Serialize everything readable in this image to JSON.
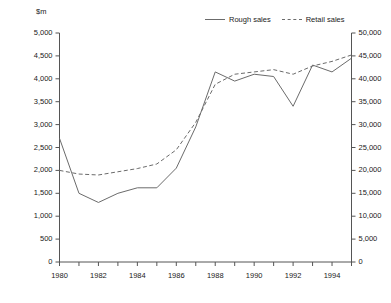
{
  "chart_data": {
    "type": "line",
    "title": "",
    "xlabel": "",
    "ylabel": "$m",
    "y2label": "",
    "x": [
      1980,
      1981,
      1982,
      1983,
      1984,
      1985,
      1986,
      1987,
      1988,
      1989,
      1990,
      1991,
      1992,
      1993,
      1994,
      1995
    ],
    "xlim": [
      1980,
      1995
    ],
    "xticks": [
      1980,
      1981,
      1982,
      1983,
      1984,
      1985,
      1986,
      1987,
      1988,
      1989,
      1990,
      1991,
      1992,
      1993,
      1994,
      1995
    ],
    "xtick_labels": [
      "1980",
      "",
      "1982",
      "",
      "1984",
      "",
      "1986",
      "",
      "1988",
      "",
      "1990",
      "",
      "1992",
      "",
      "1994",
      ""
    ],
    "ylim": [
      0,
      5000
    ],
    "yticks": [
      0,
      500,
      1000,
      1500,
      2000,
      2500,
      3000,
      3500,
      4000,
      4500,
      5000
    ],
    "ytick_labels": [
      "0",
      "500",
      "1,000",
      "1,500",
      "2,000",
      "2,500",
      "3,000",
      "3,500",
      "4,000",
      "4,500",
      "5,000"
    ],
    "y2lim": [
      0,
      50000
    ],
    "y2ticks": [
      0,
      5000,
      10000,
      15000,
      20000,
      25000,
      30000,
      35000,
      40000,
      45000,
      50000
    ],
    "y2tick_labels": [
      "0",
      "5,000",
      "10,000",
      "15,000",
      "20,000",
      "25,000",
      "30,000",
      "35,000",
      "40,000",
      "45,000",
      "50,000"
    ],
    "grid": false,
    "legend_position": "top-right",
    "series": [
      {
        "name": "Rough sales",
        "axis": "left",
        "style": "solid",
        "color": "#6b6b6b",
        "values": [
          2700,
          1500,
          1300,
          1500,
          1620,
          1620,
          2050,
          2950,
          4150,
          3950,
          4100,
          4050,
          3400,
          4300,
          4150,
          4450
        ]
      },
      {
        "name": "Retail sales",
        "axis": "right",
        "style": "dashed",
        "color": "#6b6b6b",
        "values": [
          20000,
          19200,
          19000,
          19700,
          20400,
          21400,
          24500,
          30500,
          38800,
          41000,
          41500,
          42000,
          41000,
          42800,
          43800,
          45200
        ]
      }
    ]
  }
}
